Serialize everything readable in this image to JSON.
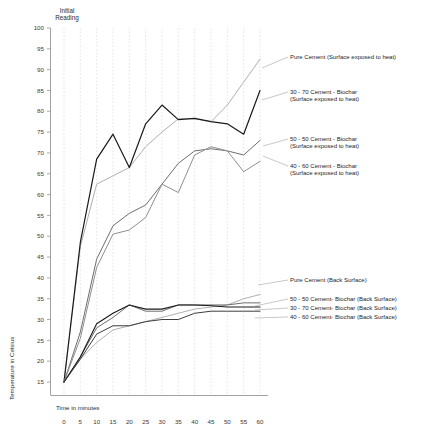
{
  "chart_data": {
    "type": "line",
    "title": "",
    "xlabel": "Time in minutes",
    "ylabel": "Temperature in Celsius",
    "xlim": [
      0,
      60
    ],
    "ylim": [
      13,
      100
    ],
    "xticks": [
      0,
      5,
      10,
      15,
      20,
      25,
      30,
      35,
      40,
      45,
      50,
      55,
      60
    ],
    "yticks": [
      15,
      20,
      25,
      30,
      35,
      40,
      45,
      50,
      55,
      60,
      65,
      70,
      75,
      80,
      85,
      90,
      95,
      100
    ],
    "grid": "vertical-dashed",
    "legend_position": "right-inline-labels",
    "annotations": [
      {
        "text": "Initial Reading",
        "x": 0,
        "y": 100
      }
    ],
    "x": [
      0,
      5,
      10,
      15,
      20,
      25,
      30,
      35,
      40,
      45,
      50,
      55,
      60
    ],
    "series": [
      {
        "name": "Pure Cement (Surface exposed to heat)",
        "color": "#b0b0b0",
        "width": 1.0,
        "values": [
          15,
          47.5,
          62.5,
          64.5,
          66.5,
          71.5,
          75,
          78.2,
          78.2,
          77.5,
          81.5,
          87,
          92.5
        ]
      },
      {
        "name": "30 - 70 Cement - Biochar (Surface exposed to heat)",
        "color": "#1a1a1a",
        "width": 1.2,
        "values": [
          15,
          48.5,
          68.5,
          74.5,
          66.5,
          77,
          81.5,
          78,
          78.3,
          77.5,
          77,
          74.5,
          85
        ]
      },
      {
        "name": "50 - 50 Cement - Biochar (Surface exposed to heat)",
        "color": "#6e6e6e",
        "width": 1.0,
        "values": [
          15,
          27,
          44.5,
          52.5,
          55.5,
          57.5,
          62.5,
          67.5,
          70.5,
          71,
          70.5,
          69.5,
          73
        ]
      },
      {
        "name": "40 - 60 Cement - Biochar (Surface exposed to heat)",
        "color": "#8f8f8f",
        "width": 1.0,
        "values": [
          15,
          25.5,
          42.5,
          50.5,
          51.5,
          54.5,
          62.5,
          60.5,
          69.5,
          71.5,
          70.5,
          65.5,
          68
        ]
      },
      {
        "name": "Pure Cement (Back Surface)",
        "color": "#b0b0b0",
        "width": 1.0,
        "values": [
          15,
          20.5,
          24.5,
          27.5,
          28.5,
          29.5,
          30.5,
          31.5,
          32.5,
          33,
          33.5,
          35,
          36
        ]
      },
      {
        "name": "50 - 50 Cement- Biochar (Back Surface)",
        "color": "#6e6e6e",
        "width": 1.0,
        "values": [
          15,
          21,
          28,
          30.5,
          33.5,
          32,
          32,
          33.5,
          33.5,
          33.5,
          33.5,
          34,
          34
        ]
      },
      {
        "name": "30 - 70 Cement- Biochar (Back Surface)",
        "color": "#1a1a1a",
        "width": 1.1,
        "values": [
          15,
          21,
          29,
          31.5,
          33.5,
          32.5,
          32.5,
          33.5,
          33.5,
          33.3,
          33,
          33,
          33
        ]
      },
      {
        "name": "40 - 60 Cement- Biochar (Back Surface)",
        "color": "#3d3d3d",
        "width": 1.0,
        "values": [
          15,
          20.5,
          26.5,
          28.5,
          28.5,
          29.5,
          30,
          30,
          31.5,
          32,
          32,
          32,
          32
        ]
      }
    ]
  },
  "labels": {
    "initial_reading": "Initial\nReading",
    "initial_reading_line1": "Initial",
    "initial_reading_line2": "Reading",
    "x_axis_title": "Time in minutes",
    "y_axis_title": "Temperature in Celsius"
  },
  "legend": {
    "items": [
      {
        "id": "pure-cement-surface",
        "lines": [
          "Pure Cement (Surface exposed to heat)"
        ]
      },
      {
        "id": "30-70-surface",
        "lines": [
          "30 - 70 Cement - Biochar",
          "(Surface exposed to heat)"
        ]
      },
      {
        "id": "50-50-surface",
        "lines": [
          "50 - 50 Cement - Biochar",
          "(Surface exposed to heat)"
        ]
      },
      {
        "id": "40-60-surface",
        "lines": [
          "40 - 60 Cement - Biochar",
          "(Surface exposed to heat)"
        ]
      },
      {
        "id": "pure-cement-back",
        "lines": [
          "Pure Cement (Back Surface)"
        ]
      },
      {
        "id": "50-50-back",
        "lines": [
          "50 - 50 Cement- Biochar (Back Surface)"
        ]
      },
      {
        "id": "30-70-back",
        "lines": [
          "30 - 70 Cement- Biochar (Back Surface)"
        ]
      },
      {
        "id": "40-60-back",
        "lines": [
          "40 - 60 Cement- Biochar (Back Surface)"
        ]
      }
    ]
  },
  "axis_tick_labels": {
    "y": [
      "100",
      "95",
      "90",
      "85",
      "80",
      "75",
      "70",
      "65",
      "60",
      "55",
      "50",
      "45",
      "40",
      "35",
      "30",
      "25",
      "20",
      "15"
    ],
    "x": [
      "0",
      "5",
      "10",
      "15",
      "20",
      "25",
      "30",
      "35",
      "40",
      "45",
      "50",
      "55",
      "60"
    ]
  },
  "colors": {
    "background": "#ffffff",
    "grid": "#d4d4d4",
    "axis": "#8a8a8a",
    "text": "#2b2b2b",
    "dark_series": "#1a1a1a",
    "mid_series": "#6e6e6e",
    "light_series": "#b0b0b0"
  }
}
